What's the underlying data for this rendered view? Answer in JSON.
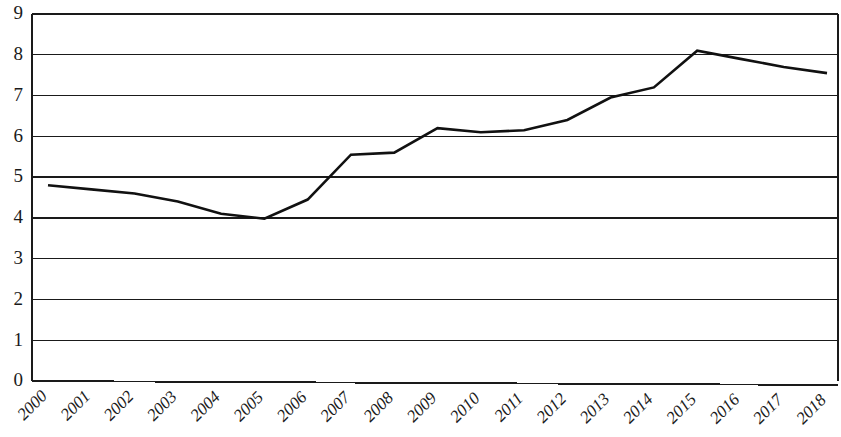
{
  "chart_data": {
    "type": "line",
    "title": "",
    "subtitle": "",
    "xlabel": "",
    "ylabel": "",
    "categories": [
      "2000",
      "2001",
      "2002",
      "2003",
      "2004",
      "2005",
      "2006",
      "2007",
      "2008",
      "2009",
      "2010",
      "2011",
      "2012",
      "2013",
      "2014",
      "2015",
      "2016",
      "2017",
      "2018"
    ],
    "values": [
      4.8,
      4.7,
      4.6,
      4.4,
      4.1,
      3.98,
      4.45,
      5.55,
      5.6,
      6.2,
      6.1,
      6.15,
      6.4,
      6.95,
      7.2,
      8.1,
      7.9,
      7.7,
      7.55
    ],
    "series": [
      {
        "name": "",
        "values": [
          4.8,
          4.7,
          4.6,
          4.4,
          4.1,
          3.98,
          4.45,
          5.55,
          5.6,
          6.2,
          6.1,
          6.15,
          6.4,
          6.95,
          7.2,
          8.1,
          7.9,
          7.7,
          7.55
        ]
      }
    ],
    "ylim": [
      0,
      9
    ],
    "yticks": [
      0,
      1,
      2,
      3,
      4,
      5,
      6,
      7,
      8,
      9
    ],
    "ytick_labels": [
      "0",
      "1",
      "2",
      "3",
      "4",
      "5",
      "6",
      "7",
      "8",
      "9"
    ],
    "xtick_labels": [
      "2000",
      "2001",
      "2002",
      "2003",
      "2004",
      "2005",
      "2006",
      "2007",
      "2008",
      "2009",
      "2010",
      "2011",
      "2012",
      "2013",
      "2014",
      "2015",
      "2016",
      "2017",
      "2018"
    ],
    "xtick_rotation": -45,
    "grid": true,
    "grid_axis": "y",
    "legend": false,
    "legend_position": "none",
    "line_color": "#111111",
    "grid_color": "#1a1a1a",
    "background_color": "#ffffff",
    "annotations": []
  }
}
